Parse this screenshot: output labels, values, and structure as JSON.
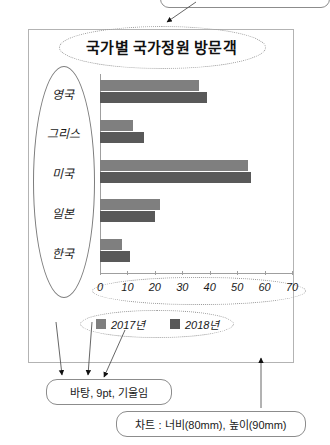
{
  "chart_data": {
    "type": "bar",
    "orientation": "horizontal",
    "title": "국가별 국가정원 방문객",
    "categories": [
      "영국",
      "그리스",
      "미국",
      "일본",
      "한국"
    ],
    "series": [
      {
        "name": "2017년",
        "values": [
          36,
          12,
          54,
          22,
          8
        ],
        "color": "#7f7f7f"
      },
      {
        "name": "2018년",
        "values": [
          39,
          16,
          55,
          20,
          11
        ],
        "color": "#595959"
      }
    ],
    "xlabel": "",
    "ylabel": "",
    "xlim": [
      0,
      70
    ],
    "xticks": [
      0,
      10,
      20,
      30,
      40,
      50,
      60,
      70
    ],
    "grid": false,
    "legend_position": "bottom"
  },
  "annotations": {
    "font_note": "바탕, 9pt, 기울임",
    "chart_size_note": "차트 : 너비(80mm), 높이(90mm)"
  },
  "icons": {
    "arrow_down": "arrow-down-icon",
    "arrow_up": "arrow-up-icon"
  }
}
